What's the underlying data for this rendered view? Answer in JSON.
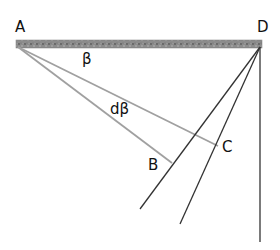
{
  "labels": {
    "A": "A",
    "D": "D",
    "B": "B",
    "C": "C",
    "beta": "β",
    "dbeta": "dβ"
  },
  "colors": {
    "bar_fill": "#8a8a8a",
    "ray_from_A": "#9a9a9a",
    "ray_from_D": "#333333",
    "text": "#111111"
  },
  "geometry": {
    "A": [
      18,
      45
    ],
    "D": [
      260,
      45
    ],
    "B": [
      172,
      163
    ],
    "C": [
      218,
      146
    ],
    "ray_end_1": [
      140,
      209
    ],
    "ray_end_2": [
      180,
      224
    ],
    "vertical_end": [
      260,
      242
    ]
  }
}
